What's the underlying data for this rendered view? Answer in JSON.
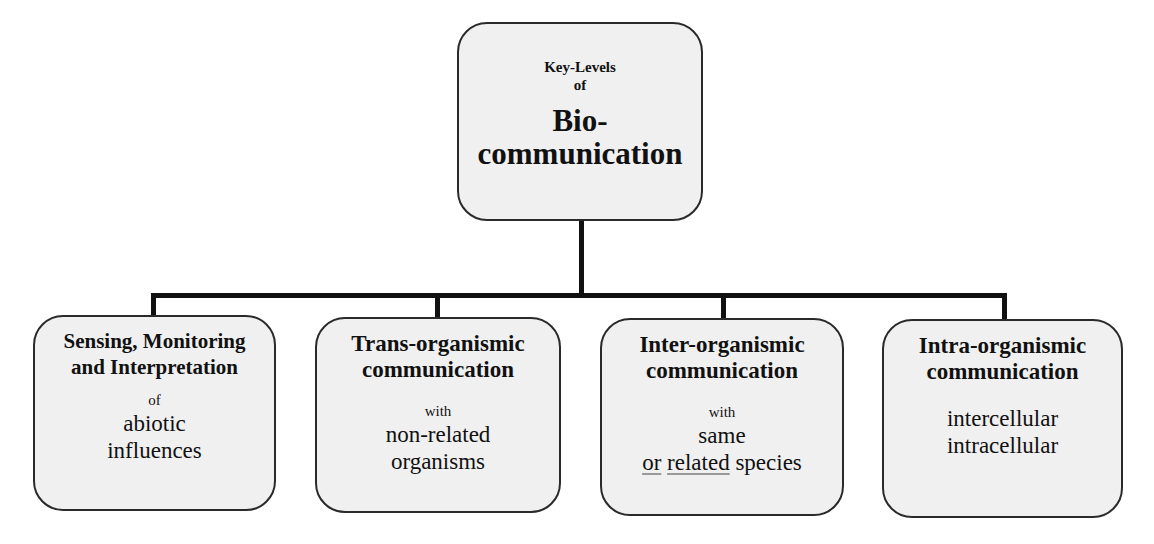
{
  "diagram": {
    "type": "tree",
    "root": {
      "line1": "Key-Levels",
      "line2": "of",
      "line3": "Bio-",
      "line4": "communication"
    },
    "children": [
      {
        "title_line1": "Sensing, Monitoring",
        "title_line2": "and Interpretation",
        "connector": "of",
        "body_line1": "abiotic",
        "body_line2": "influences"
      },
      {
        "title_line1": "Trans-organismic",
        "title_line2": "communication",
        "connector": "with",
        "body_line1": "non-related",
        "body_line2": "organisms"
      },
      {
        "title_line1": "Inter-organismic",
        "title_line2": "communication",
        "connector": "with",
        "body_line1": "same",
        "body_line2_part1": "or",
        "body_line2_part2": "related",
        "body_line2_part3": "species"
      },
      {
        "title_line1": "Intra-organismic",
        "title_line2": "communication",
        "body_line1": "intercellular",
        "body_line2": "intracellular"
      }
    ],
    "colors": {
      "box_fill": "#f0f0f0",
      "box_border": "#2a2a2a",
      "connector": "#111111",
      "background": "#ffffff"
    }
  }
}
